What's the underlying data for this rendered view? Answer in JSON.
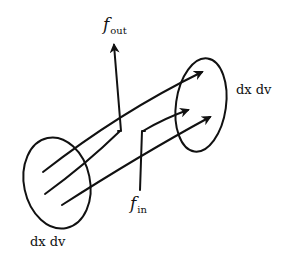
{
  "diagram": {
    "labels": {
      "f_out": {
        "main": "f",
        "sub": "out"
      },
      "f_in": {
        "main": "f",
        "sub": "in"
      },
      "volume_right": "dx dv",
      "volume_left": "dx dv"
    },
    "colors": {
      "stroke": "#111111",
      "background": "#ffffff"
    },
    "elements": {
      "left_ellipse": {
        "cx": 57,
        "cy": 183,
        "rx": 34,
        "ry": 46
      },
      "right_ellipse": {
        "cx": 200,
        "cy": 105,
        "rx": 26,
        "ry": 47
      },
      "flow_arrows": 3,
      "out_arrow": "f_out",
      "in_line": "f_in"
    }
  }
}
